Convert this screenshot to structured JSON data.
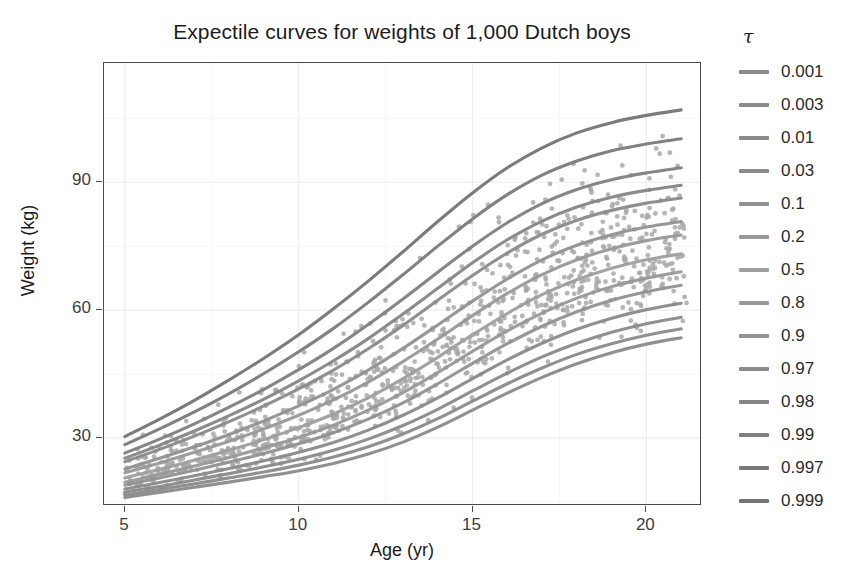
{
  "chart_data": {
    "type": "line",
    "title": "Expectile curves for weights of 1,000 Dutch boys",
    "xlabel": "Age (yr)",
    "ylabel": "Weight (kg)",
    "xlim": [
      4.4,
      21.6
    ],
    "ylim": [
      14,
      118
    ],
    "xticks": [
      5,
      10,
      15,
      20
    ],
    "yticks": [
      30,
      60,
      90
    ],
    "grid": true,
    "legend_position": "right",
    "legend_title": "τ",
    "x": [
      5,
      6,
      7,
      8,
      9,
      10,
      11,
      12,
      13,
      14,
      15,
      16,
      17,
      18,
      19,
      20,
      21
    ],
    "series": [
      {
        "name": "0.001",
        "label": "0.001",
        "color": "#8a8a8a",
        "values": [
          16.0,
          17.2,
          18.4,
          19.6,
          20.9,
          22.3,
          24.0,
          26.2,
          29.0,
          32.5,
          36.5,
          40.5,
          44.2,
          47.4,
          50.0,
          52.0,
          53.5
        ]
      },
      {
        "name": "0.003",
        "label": "0.003",
        "color": "#8a8a8a",
        "values": [
          16.6,
          17.9,
          19.2,
          20.6,
          22.0,
          23.6,
          25.5,
          27.9,
          30.9,
          34.5,
          38.6,
          42.7,
          46.4,
          49.6,
          52.1,
          54.1,
          55.6
        ]
      },
      {
        "name": "0.01",
        "label": "0.01",
        "color": "#8a8a8a",
        "values": [
          17.3,
          18.6,
          20.1,
          21.6,
          23.2,
          25.0,
          27.1,
          29.7,
          32.9,
          36.7,
          41.0,
          45.2,
          49.0,
          52.2,
          54.8,
          56.8,
          58.3
        ]
      },
      {
        "name": "0.03",
        "label": "0.03",
        "color": "#8a8a8a",
        "values": [
          18.0,
          19.5,
          21.1,
          22.8,
          24.6,
          26.6,
          28.9,
          31.8,
          35.3,
          39.4,
          43.9,
          48.3,
          52.2,
          55.5,
          58.1,
          60.1,
          61.6
        ]
      },
      {
        "name": "0.1",
        "label": "0.1",
        "color": "#919191",
        "values": [
          18.9,
          20.6,
          22.4,
          24.3,
          26.3,
          28.6,
          31.2,
          34.4,
          38.2,
          42.7,
          47.5,
          52.1,
          56.2,
          59.6,
          62.3,
          64.3,
          65.8
        ]
      },
      {
        "name": "0.2",
        "label": "0.2",
        "color": "#989898",
        "values": [
          19.6,
          21.4,
          23.4,
          25.4,
          27.7,
          30.1,
          33.0,
          36.5,
          40.6,
          45.3,
          50.3,
          55.1,
          59.3,
          62.8,
          65.5,
          67.5,
          69.0
        ]
      },
      {
        "name": "0.5",
        "label": "0.5",
        "color": "#9e9e9e",
        "values": [
          20.6,
          22.6,
          24.8,
          27.1,
          29.6,
          32.4,
          35.6,
          39.4,
          43.9,
          48.9,
          54.2,
          59.2,
          63.6,
          67.1,
          69.8,
          71.8,
          73.2
        ]
      },
      {
        "name": "0.8",
        "label": "0.8",
        "color": "#989898",
        "values": [
          21.8,
          24.1,
          26.6,
          29.2,
          32.1,
          35.3,
          38.9,
          43.1,
          47.9,
          53.2,
          58.7,
          63.9,
          68.3,
          71.8,
          74.4,
          76.3,
          77.6
        ]
      },
      {
        "name": "0.9",
        "label": "0.9",
        "color": "#919191",
        "values": [
          22.7,
          25.2,
          27.9,
          30.8,
          34.0,
          37.5,
          41.4,
          45.9,
          51.0,
          56.5,
          62.1,
          67.3,
          71.8,
          75.2,
          77.7,
          79.5,
          80.8
        ]
      },
      {
        "name": "0.97",
        "label": "0.97",
        "color": "#8a8a8a",
        "values": [
          24.4,
          27.3,
          30.4,
          33.8,
          37.5,
          41.5,
          45.9,
          50.9,
          56.4,
          62.3,
          68.1,
          73.4,
          77.8,
          81.1,
          83.4,
          85.1,
          86.3
        ]
      },
      {
        "name": "0.98",
        "label": "0.98",
        "color": "#858585",
        "values": [
          25.2,
          28.3,
          31.6,
          35.2,
          39.1,
          43.4,
          48.1,
          53.3,
          59.1,
          65.1,
          71.1,
          76.5,
          80.9,
          84.2,
          86.5,
          88.1,
          89.3
        ]
      },
      {
        "name": "0.99",
        "label": "0.99",
        "color": "#808080",
        "values": [
          26.4,
          29.7,
          33.3,
          37.2,
          41.4,
          46.0,
          51.0,
          56.6,
          62.6,
          68.9,
          75.0,
          80.5,
          85.0,
          88.3,
          90.6,
          92.2,
          93.4
        ]
      },
      {
        "name": "0.997",
        "label": "0.997",
        "color": "#7a7a7a",
        "values": [
          28.4,
          32.1,
          36.1,
          40.4,
          45.1,
          50.2,
          55.7,
          61.8,
          68.3,
          75.0,
          81.4,
          87.1,
          91.7,
          95.0,
          97.4,
          99.0,
          100.2
        ]
      },
      {
        "name": "0.999",
        "label": "0.999",
        "color": "#747474",
        "values": [
          30.3,
          34.4,
          38.8,
          43.6,
          48.7,
          54.2,
          60.3,
          66.8,
          73.7,
          80.8,
          87.5,
          93.4,
          98.1,
          101.6,
          104.0,
          105.7,
          107.0
        ]
      }
    ],
    "scatter": {
      "label": "1,000 Dutch boys",
      "n": 1000,
      "color": "#a8a8a8",
      "marker": "circle",
      "size": 3
    }
  },
  "axes": {
    "y_ticks": [
      {
        "value": 90,
        "label": "90"
      },
      {
        "value": 60,
        "label": "60"
      },
      {
        "value": 30,
        "label": "30"
      }
    ],
    "x_ticks": [
      {
        "value": 5,
        "label": "5"
      },
      {
        "value": 10,
        "label": "10"
      },
      {
        "value": 15,
        "label": "15"
      },
      {
        "value": 20,
        "label": "20"
      }
    ]
  },
  "style": {
    "panel_border": "#4a4a4a",
    "grid_major": "#ededed",
    "grid_minor": "#f6f6f6",
    "background": "#ffffff",
    "text": "#1c1c1c",
    "tick_text": "#3d3d3d"
  }
}
